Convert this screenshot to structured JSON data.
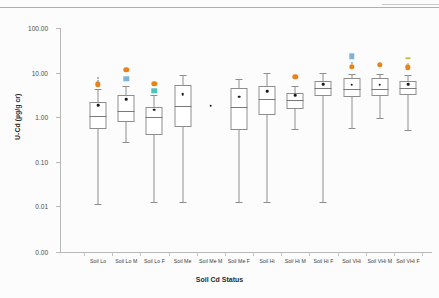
{
  "figure": {
    "xlabel": "Soil Cd Status",
    "ylabel": "U-Cd (µg/g cr)"
  },
  "colors": {
    "outlier_orange": "#E8821E",
    "outlier_blue": "#7FB4D8",
    "outlier_teal": "#4EC3B8",
    "outlier_olive": "#C9C24A",
    "box_line": "#8d8d8d",
    "axis": "#b9b9b9",
    "mean_marker": "#1a1a1a",
    "background": "#fcfcfc"
  },
  "chart_data": {
    "type": "box",
    "title": "",
    "xlabel": "Soil Cd Status",
    "ylabel": "U-Cd (µg/g cr)",
    "yscale": "log",
    "ylim": [
      0.004,
      100.0
    ],
    "ytick_labels": [
      "100.00",
      "10.00",
      "1.00",
      "0.10",
      "0.01",
      "0.00"
    ],
    "ytick_values": [
      100.0,
      10.0,
      1.0,
      0.1,
      0.01,
      0.004
    ],
    "grid": false,
    "legend": "none",
    "categories": [
      "Soil Lo",
      "Soil Lo M",
      "Soil Lo F",
      "Soil Me",
      "Soil Me M",
      "Soil Me F",
      "Soil Hi",
      "Soil Hi M",
      "Soil Hi F",
      "Soil VHi",
      "Soil VHi M",
      "Soil VHi F"
    ],
    "boxes": [
      {
        "category": "Soil Lo",
        "whisker_low": 0.011,
        "q1": 0.55,
        "median": 1.05,
        "q3": 2.15,
        "whisker_high": 4.2,
        "mean": 1.85,
        "outliers": [
          {
            "value": 5.4,
            "marker": "circle",
            "color": "#E8821E"
          },
          {
            "value": 7.6,
            "marker": "small",
            "color": "#9a9a9a"
          },
          {
            "value": 6.3,
            "marker": "small-blue",
            "color": "#7FB4D8"
          }
        ]
      },
      {
        "category": "Soil Lo M",
        "whisker_low": 0.27,
        "q1": 0.76,
        "median": 1.35,
        "q3": 3.05,
        "whisker_high": 5.0,
        "mean": 2.55,
        "outliers": [
          {
            "value": 11.5,
            "marker": "circle",
            "color": "#E8821E"
          },
          {
            "value": 7.3,
            "marker": "square",
            "color": "#7FB4D8"
          }
        ]
      },
      {
        "category": "Soil Lo F",
        "whisker_low": 0.012,
        "q1": 0.4,
        "median": 1.02,
        "q3": 1.7,
        "whisker_high": 3.2,
        "mean": 1.45,
        "outliers": [
          {
            "value": 5.6,
            "marker": "circle",
            "color": "#E8821E"
          },
          {
            "value": 3.9,
            "marker": "square",
            "color": "#4EC3B8"
          }
        ]
      },
      {
        "category": "Soil Me",
        "whisker_low": 0.012,
        "q1": 0.6,
        "median": 1.8,
        "q3": 5.3,
        "whisker_high": 9.0,
        "mean": 3.3,
        "outliers": []
      },
      {
        "category": "Soil Me M",
        "whisker_low": null,
        "q1": null,
        "median": null,
        "q3": null,
        "whisker_high": null,
        "mean": 1.8,
        "outliers": []
      },
      {
        "category": "Soil Me F",
        "whisker_low": 0.012,
        "q1": 0.5,
        "median": 1.65,
        "q3": 4.6,
        "whisker_high": 7.2,
        "mean": 2.85,
        "outliers": []
      },
      {
        "category": "Soil Hi",
        "whisker_low": 0.012,
        "q1": 1.1,
        "median": 2.55,
        "q3": 5.0,
        "whisker_high": 9.5,
        "mean": 3.8,
        "outliers": []
      },
      {
        "category": "Soil Hi M",
        "whisker_low": 0.55,
        "q1": 1.55,
        "median": 2.45,
        "q3": 3.55,
        "whisker_high": 5.0,
        "mean": 3.05,
        "outliers": [
          {
            "value": 8.0,
            "marker": "circle",
            "color": "#E8821E"
          }
        ]
      },
      {
        "category": "Soil Hi F",
        "whisker_low": 0.012,
        "q1": 2.9,
        "median": 4.4,
        "q3": 6.3,
        "whisker_high": 9.8,
        "mean": 5.4,
        "outliers": []
      },
      {
        "category": "Soil VHi",
        "whisker_low": 0.56,
        "q1": 2.8,
        "median": 4.3,
        "q3": 7.6,
        "whisker_high": 9.2,
        "mean": 5.3,
        "outliers": [
          {
            "value": 23.0,
            "marker": "square",
            "color": "#7FB4D8"
          },
          {
            "value": 13.5,
            "marker": "circle",
            "color": "#E8821E"
          },
          {
            "value": 16.0,
            "marker": "small",
            "color": "#7FB4D8"
          }
        ]
      },
      {
        "category": "Soil VHi M",
        "whisker_low": 0.95,
        "q1": 2.9,
        "median": 4.3,
        "q3": 7.4,
        "whisker_high": 9.3,
        "mean": 5.3,
        "outliers": [
          {
            "value": 15.0,
            "marker": "circle",
            "color": "#E8821E"
          }
        ]
      },
      {
        "category": "Soil VHi F",
        "whisker_low": 0.5,
        "q1": 3.2,
        "median": 4.5,
        "q3": 6.6,
        "whisker_high": 9.0,
        "mean": 5.4,
        "outliers": [
          {
            "value": 21.0,
            "marker": "dash",
            "color": "#C9C24A"
          },
          {
            "value": 13.0,
            "marker": "circle",
            "color": "#E8821E"
          },
          {
            "value": 15.5,
            "marker": "small",
            "color": "#C9C24A"
          }
        ]
      }
    ]
  }
}
